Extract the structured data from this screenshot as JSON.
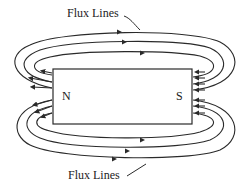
{
  "diagram": {
    "magnet": {
      "north_label": "N",
      "south_label": "S"
    },
    "labels": {
      "top": "Flux Lines",
      "bottom": "Flux Lines"
    },
    "colors": {
      "line": "#2a2a2a",
      "background": "#ffffff"
    }
  }
}
